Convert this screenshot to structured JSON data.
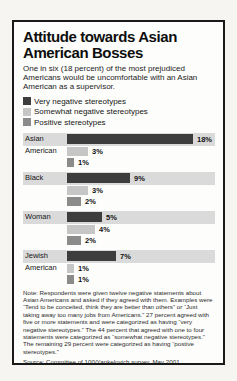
{
  "card": {
    "title": "Attitude towards Asian American Bosses",
    "subtitle": "One in six (18 percent) of the most prejudiced Americans would be uncomfortable with an Asian American as a supervisor.",
    "note": "Note: Respondents were given twelve negative statements about Asian Americans and asked if they agreed with them. Examples were “Tend to be conceited, think they are better than others” or “Just taking away too many jobs from Americans.” 27 percent agreed with five or more statements and were categorized as having “very negative stereotypes.” The 44 percent that agreed with one to four statements were categorized as “somewhat negative stereotypes.” The remaining 29 percent were categorized as having “postive stereotypes.”",
    "source": "Source: Committee of 100/Yankelovich survey, May 2001"
  },
  "chart_data": {
    "type": "bar",
    "orientation": "horizontal",
    "title": "Attitude towards Asian American Bosses",
    "categories": [
      "Asian American",
      "Black",
      "Woman",
      "Jewish American"
    ],
    "category_lines": [
      [
        "Asian",
        "American",
        ""
      ],
      [
        "Black",
        "",
        ""
      ],
      [
        "Woman",
        "",
        ""
      ],
      [
        "Jewish",
        "American",
        ""
      ]
    ],
    "series": [
      {
        "name": "Very negative stereotypes",
        "color": "#3d3d3d",
        "values": [
          18,
          9,
          5,
          7
        ]
      },
      {
        "name": "Somewhat negative stereotypes",
        "color": "#c6c6c6",
        "values": [
          3,
          3,
          4,
          1
        ]
      },
      {
        "name": "Positive stereotypes",
        "color": "#8b8b8b",
        "values": [
          1,
          2,
          2,
          1
        ]
      }
    ],
    "value_suffix": "%",
    "xlim": [
      0,
      19
    ],
    "grid": false,
    "legend_position": "top-left",
    "band_color": "#dadada"
  }
}
